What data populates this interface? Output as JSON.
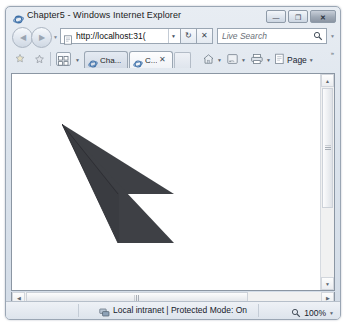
{
  "window": {
    "title": "Chapter5 - Windows Internet Explorer",
    "title_icon": "ie-logo-icon",
    "controls": [
      {
        "name": "minimize-button",
        "glyph": "—"
      },
      {
        "name": "maximize-button",
        "glyph": "❐"
      },
      {
        "name": "close-button",
        "glyph": "✕"
      }
    ]
  },
  "nav": {
    "back_label": "◀",
    "forward_label": "▶",
    "history_caret": "▼",
    "address": {
      "url": "http://localhost:31(",
      "favicon": "page-icon",
      "caret": "▼"
    },
    "refresh_glyph": "↻",
    "stop_glyph": "✕",
    "search": {
      "placeholder": "Live Search",
      "icon": "search-icon",
      "caret": "▼"
    }
  },
  "toolbar": {
    "add_favorite_icon": "star-plus-icon",
    "favorites_center_icon": "favorites-icon",
    "quick_tabs_icon": "quick-tabs-icon",
    "quick_tabs_caret": "▼",
    "tabs": [
      {
        "label": "Cha...",
        "favicon": "page-icon",
        "close": "",
        "active": false
      },
      {
        "label": "C...",
        "favicon": "page-icon",
        "close": "✕",
        "active": true
      }
    ],
    "new_tab_label": "",
    "commands": [
      {
        "name": "home-button",
        "icon": "home-icon",
        "label": "",
        "caret": "▼"
      },
      {
        "name": "feeds-button",
        "icon": "rss-icon",
        "label": "",
        "caret": "▼"
      },
      {
        "name": "print-button",
        "icon": "printer-icon",
        "label": "",
        "caret": "▼"
      },
      {
        "name": "page-menu-button",
        "icon": "page-icon",
        "label": "Page",
        "caret": "▼"
      }
    ],
    "overflow_glyph": "»"
  },
  "status": {
    "zone_icon": "intranet-icon",
    "text": "Local intranet | Protected Mode: On",
    "zoom_icon": "zoom-icon",
    "zoom_level": "100%",
    "zoom_caret": "▼"
  },
  "scrollbars": {
    "vertical": {
      "up": "▲",
      "down": "▼"
    },
    "horizontal": {
      "left": "◀",
      "right": "▶"
    }
  },
  "canvas": {
    "shape_name": "dark-chevron-polygon",
    "fill_color": "#3e4045",
    "edge_color": "#2c2e33",
    "polygons": [
      {
        "name": "upper-wing",
        "points": "0,0 112,70 56,70"
      },
      {
        "name": "lower-wing",
        "points": "0,0 112,118 56,118"
      },
      {
        "name": "spine",
        "points": "0,0 56,70 56,118"
      }
    ]
  }
}
